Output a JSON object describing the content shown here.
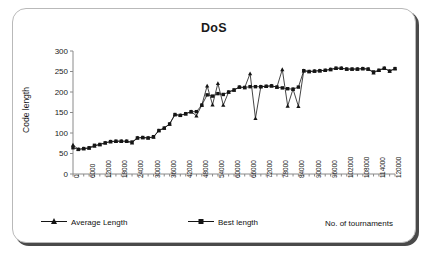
{
  "chart_data": {
    "type": "line",
    "title": "DoS",
    "xlabel": "No. of tournaments",
    "ylabel": "Code length",
    "xlim": [
      0,
      120000
    ],
    "ylim": [
      0,
      300
    ],
    "ytick_labels": [
      "0",
      "50",
      "100",
      "150",
      "200",
      "250",
      "300"
    ],
    "ytick_values": [
      0,
      50,
      100,
      150,
      200,
      250,
      300
    ],
    "xtick_labels": [
      "0",
      "6000",
      "12000",
      "18000",
      "24000",
      "30000",
      "36000",
      "42000",
      "48000",
      "54000",
      "60000",
      "66000",
      "72000",
      "78000",
      "84000",
      "90000",
      "96000",
      "102000",
      "108000",
      "114000",
      "120000"
    ],
    "xtick_values": [
      0,
      6000,
      12000,
      18000,
      24000,
      30000,
      36000,
      42000,
      48000,
      54000,
      60000,
      66000,
      72000,
      78000,
      84000,
      90000,
      96000,
      102000,
      108000,
      114000,
      120000
    ],
    "grid": false,
    "legend_position": "bottom",
    "x": [
      0,
      2000,
      4000,
      6000,
      8000,
      10000,
      12000,
      14000,
      16000,
      18000,
      20000,
      22000,
      24000,
      26000,
      28000,
      30000,
      32000,
      34000,
      36000,
      38000,
      40000,
      42000,
      44000,
      46000,
      48000,
      50000,
      52000,
      54000,
      56000,
      58000,
      60000,
      62000,
      64000,
      66000,
      68000,
      70000,
      72000,
      74000,
      76000,
      78000,
      80000,
      82000,
      84000,
      86000,
      88000,
      90000,
      92000,
      94000,
      96000,
      98000,
      100000,
      102000,
      104000,
      106000,
      108000,
      110000,
      112000,
      114000,
      116000,
      118000,
      120000
    ],
    "series": [
      {
        "name": "Average Length",
        "marker": "triangle",
        "color": "#151515",
        "values": [
          71,
          60,
          62,
          63,
          68,
          72,
          76,
          79,
          80,
          80,
          80,
          76,
          88,
          89,
          88,
          90,
          106,
          112,
          122,
          145,
          143,
          147,
          152,
          142,
          168,
          215,
          169,
          221,
          168,
          200,
          205,
          212,
          211,
          245,
          136,
          213,
          214,
          215,
          212,
          255,
          166,
          207,
          165,
          252,
          250,
          251,
          252,
          253,
          255,
          258,
          258,
          256,
          256,
          256,
          257,
          256,
          247,
          253,
          258,
          251,
          257
        ]
      },
      {
        "name": "Best length",
        "marker": "square",
        "color": "#151515",
        "values": [
          64,
          60,
          62,
          64,
          70,
          72,
          76,
          79,
          80,
          80,
          80,
          78,
          88,
          89,
          88,
          91,
          106,
          112,
          122,
          145,
          143,
          147,
          152,
          152,
          168,
          193,
          190,
          196,
          194,
          200,
          205,
          212,
          211,
          213,
          213,
          213,
          214,
          215,
          212,
          210,
          208,
          207,
          212,
          252,
          250,
          251,
          252,
          253,
          255,
          258,
          258,
          256,
          256,
          256,
          257,
          256,
          249,
          253,
          258,
          251,
          257
        ]
      }
    ]
  },
  "legend": {
    "average_label": "Average Length",
    "best_label": "Best length"
  }
}
